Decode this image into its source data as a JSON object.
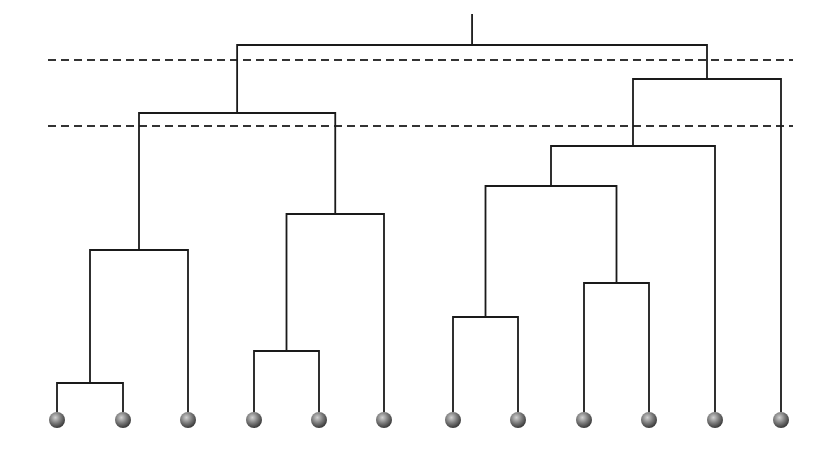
{
  "diagram": {
    "type": "dendrogram",
    "line_color": "#1a1a1a",
    "dash_color": "#333333",
    "leaf_color": "#7a7a7a",
    "leaf_highlight": "#d0d0d0",
    "leaf_shadow": "#3a3a3a",
    "root_top_y": 14,
    "leaf_top_y": 412,
    "leaf_center_y": 420,
    "leaf_radius": 8,
    "cut_lines": [
      {
        "name": "cut-line-upper",
        "y": 60,
        "x1": 48,
        "x2": 793
      },
      {
        "name": "cut-line-lower",
        "y": 126,
        "x1": 48,
        "x2": 793
      }
    ],
    "leaves": [
      {
        "id": "L1",
        "x": 57
      },
      {
        "id": "L2",
        "x": 123
      },
      {
        "id": "L3",
        "x": 188
      },
      {
        "id": "L4",
        "x": 254
      },
      {
        "id": "L5",
        "x": 319
      },
      {
        "id": "L6",
        "x": 384
      },
      {
        "id": "L7",
        "x": 453
      },
      {
        "id": "L8",
        "x": 518
      },
      {
        "id": "L9",
        "x": 584
      },
      {
        "id": "L10",
        "x": 649
      },
      {
        "id": "L11",
        "x": 715
      },
      {
        "id": "L12",
        "x": 781
      }
    ],
    "merges": [
      {
        "id": "A",
        "left": "L1",
        "right": "L2",
        "y": 383
      },
      {
        "id": "B",
        "left": "A",
        "right": "L3",
        "y": 250
      },
      {
        "id": "C",
        "left": "L4",
        "right": "L5",
        "y": 351
      },
      {
        "id": "D",
        "left": "C",
        "right": "L6",
        "y": 214
      },
      {
        "id": "E",
        "left": "B",
        "right": "D",
        "y": 113
      },
      {
        "id": "F",
        "left": "L7",
        "right": "L8",
        "y": 317
      },
      {
        "id": "G",
        "left": "L9",
        "right": "L10",
        "y": 283
      },
      {
        "id": "H",
        "left": "F",
        "right": "G",
        "y": 186
      },
      {
        "id": "I",
        "left": "H",
        "right": "L11",
        "y": 146
      },
      {
        "id": "J",
        "left": "I",
        "right": "L12",
        "y": 79
      },
      {
        "id": "ROOT",
        "left": "E",
        "right": "J",
        "y": 45
      }
    ]
  }
}
